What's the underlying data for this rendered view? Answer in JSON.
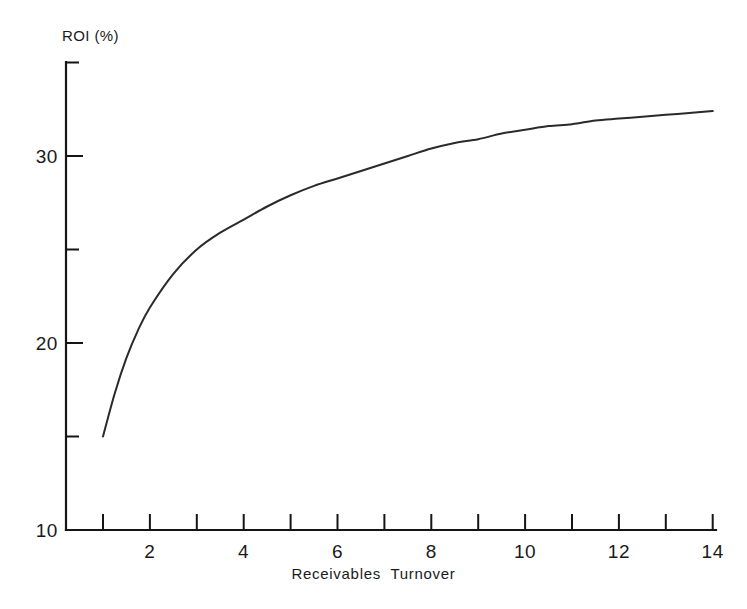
{
  "chart_data": {
    "type": "line",
    "title": "",
    "xlabel": "Receivables  Turnover",
    "ylabel": "ROI (%)",
    "xlim": [
      0.45,
      14.35
    ],
    "ylim": [
      10,
      35.5
    ],
    "grid": false,
    "legend": null,
    "x_ticks_major": [
      2,
      4,
      6,
      8,
      10,
      12,
      14
    ],
    "x_ticks_major_labels": [
      "2",
      "4",
      "6",
      "8",
      "10",
      "12",
      "14"
    ],
    "x_ticks_minor": [
      1,
      3,
      5,
      7,
      9,
      11,
      13
    ],
    "y_ticks_major": [
      10,
      20,
      30
    ],
    "y_ticks_major_labels": [
      "10",
      "20",
      "30"
    ],
    "y_ticks_minor": [
      15,
      25,
      35
    ],
    "series": [
      {
        "name": "ROI vs Receivables Turnover",
        "x": [
          1,
          1.25,
          1.5,
          1.75,
          2,
          2.5,
          3,
          3.5,
          4,
          4.5,
          5,
          5.5,
          6,
          6.5,
          7,
          7.5,
          8,
          8.5,
          9,
          9.5,
          10,
          10.5,
          11,
          11.5,
          12,
          12.5,
          13,
          13.5,
          14
        ],
        "values": [
          15.0,
          17.3,
          19.2,
          20.7,
          21.9,
          23.7,
          25.0,
          25.9,
          26.6,
          27.3,
          27.9,
          28.4,
          28.8,
          29.2,
          29.6,
          30.0,
          30.4,
          30.7,
          30.9,
          31.2,
          31.4,
          31.6,
          31.7,
          31.9,
          32.0,
          32.1,
          32.2,
          32.3,
          32.4
        ]
      }
    ]
  },
  "axes": {
    "y_axis_title": "ROI (%)",
    "x_axis_title": "Receivables  Turnover",
    "y_labels": [
      "30",
      "20",
      "10"
    ],
    "x_labels": [
      "2",
      "4",
      "6",
      "8",
      "10",
      "12",
      "14"
    ]
  }
}
